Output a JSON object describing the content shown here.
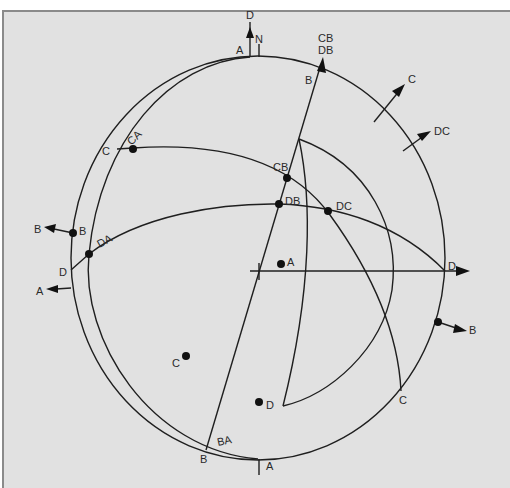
{
  "figure": {
    "type": "stereographic-projection",
    "primitive": {
      "cx": 258,
      "cy": 258,
      "rx": 187,
      "ry": 202
    },
    "top_labels": {
      "north": "N",
      "A_top": "A",
      "D_arrow": "D",
      "B_top": "B"
    },
    "arrow_labels": {
      "CB_DB_line_top1": "CB",
      "CB_DB_line_top2": "DB",
      "C_arrow": "C",
      "DC_arrow": "DC",
      "B_left_arrow": "B",
      "A_left_arrow": "A",
      "D_right_arrow": "D",
      "B_right_arrow": "B"
    },
    "circle_labels": {
      "C_left": "C",
      "CA": "CA",
      "B_left": "B",
      "DA": "DA",
      "D_left": "D",
      "CB": "CB",
      "DB": "DB",
      "DC": "DC",
      "C_bottom_right": "C",
      "BA": "BA",
      "B_bottom": "B",
      "A_bottom": "A"
    },
    "poles": [
      {
        "label": "A",
        "x": 281,
        "y": 264
      },
      {
        "label": "C",
        "x": 186,
        "y": 356
      },
      {
        "label": "D",
        "x": 259,
        "y": 402
      }
    ],
    "intersections": [
      {
        "label": "CA",
        "x": 133,
        "y": 149
      },
      {
        "label": "B",
        "x": 73,
        "y": 233
      },
      {
        "label": "DA",
        "x": 89,
        "y": 254
      },
      {
        "label": "CB",
        "x": 287,
        "y": 178
      },
      {
        "label": "DB",
        "x": 279,
        "y": 204
      },
      {
        "label": "DC",
        "x": 328,
        "y": 211
      },
      {
        "label": "B",
        "x": 438,
        "y": 322
      }
    ]
  }
}
